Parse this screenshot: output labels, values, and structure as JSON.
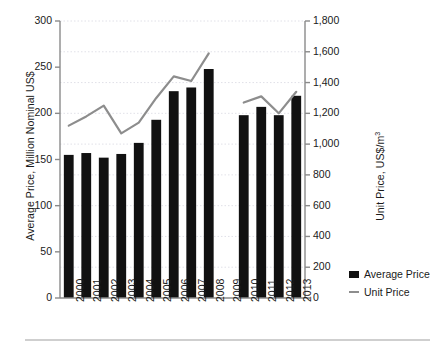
{
  "chart_data": {
    "type": "bar",
    "title": "",
    "subtitle": "",
    "categories": [
      "2000",
      "2001",
      "2002",
      "2003",
      "2004",
      "2005",
      "2006",
      "2007",
      "2008",
      "2009",
      "2010",
      "2011",
      "2012",
      "2013"
    ],
    "xlabel": "",
    "ylabel": "Average Price, Million Nominal US$",
    "y2label": "Unit Price, US$/m",
    "y2label_sup": "3",
    "ylim": [
      0,
      300
    ],
    "y2lim": [
      0,
      1800
    ],
    "yticks": [
      "0",
      "50",
      "100",
      "150",
      "200",
      "250",
      "300"
    ],
    "ytick_values": [
      0,
      50,
      100,
      150,
      200,
      250,
      300
    ],
    "y2ticks": [
      "0",
      "200",
      "400",
      "600",
      "800",
      "1,000",
      "1,200",
      "1,400",
      "1,600",
      "1,800"
    ],
    "y2tick_values": [
      0,
      200,
      400,
      600,
      800,
      1000,
      1200,
      1400,
      1600,
      1800
    ],
    "grid": true,
    "grid_axis": "y",
    "legend_position": "right",
    "series": [
      {
        "name": "Average Price",
        "type": "bar",
        "axis": "left",
        "color": "#111111",
        "values": [
          155,
          157,
          152,
          156,
          168,
          193,
          224,
          228,
          248,
          null,
          198,
          207,
          198,
          219
        ]
      },
      {
        "name": "Unit Price",
        "type": "line",
        "axis": "right",
        "color": "#8d8d8d",
        "values": [
          1120,
          1180,
          1250,
          1070,
          1140,
          1300,
          1440,
          1410,
          1590,
          null,
          1270,
          1310,
          1200,
          1340
        ]
      }
    ]
  },
  "legend": {
    "items": [
      {
        "label": "Average Price",
        "marker": "square-marker",
        "color": "#111111"
      },
      {
        "label": "Unit Price",
        "marker": "line-marker",
        "color": "#8d8d8d"
      }
    ]
  },
  "axes": {
    "left_title": "Average Price, Million Nominal US$",
    "right_title_main": "Unit Price, US$/m",
    "right_title_sup": "3"
  }
}
